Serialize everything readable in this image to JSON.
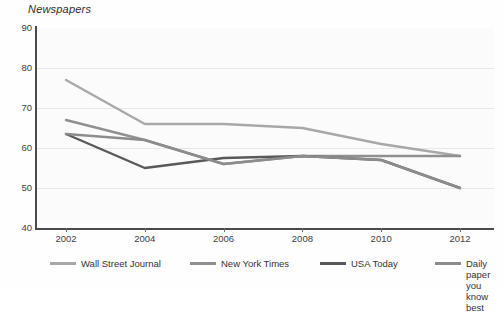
{
  "chart_data": {
    "type": "line",
    "title": "Newspapers",
    "xlabel": "",
    "ylabel": "",
    "x": [
      2002,
      2004,
      2006,
      2008,
      2010,
      2012
    ],
    "xticklabels": [
      "2002",
      "2004",
      "2006",
      "2008",
      "2010",
      "2012"
    ],
    "yticklabels": [
      "90",
      "80",
      "70",
      "60",
      "50",
      "40"
    ],
    "yticks": [
      90,
      80,
      70,
      60,
      50,
      40
    ],
    "ylim": [
      40,
      90
    ],
    "xlim": [
      2002,
      2012
    ],
    "grid": true,
    "legend_position": "bottom",
    "series": [
      {
        "name": "Wall Street Journal",
        "color": "#a8a8a8",
        "values": [
          77,
          66,
          66,
          65,
          61,
          58
        ]
      },
      {
        "name": "New York Times",
        "color": "#909090",
        "values": [
          67,
          62,
          56,
          58,
          58,
          58
        ]
      },
      {
        "name": "USA Today",
        "color": "#595959",
        "values": [
          63.5,
          55,
          57.5,
          58,
          57,
          50
        ]
      },
      {
        "name": "Daily paper you know best",
        "color": "#8c8c8c",
        "values": [
          63.5,
          62,
          56,
          58,
          57,
          50
        ]
      }
    ]
  },
  "chart": {
    "title": "Newspapers",
    "y_axis": {
      "ticks": [
        "90",
        "80",
        "70",
        "60",
        "50",
        "40"
      ]
    },
    "x_axis": {
      "ticks": [
        "2002",
        "2004",
        "2006",
        "2008",
        "2010",
        "2012"
      ]
    },
    "legend": {
      "items": [
        {
          "label": "Wall Street Journal",
          "color": "#a8a8a8"
        },
        {
          "label": "New York Times",
          "color": "#909090"
        },
        {
          "label": "USA Today",
          "color": "#595959"
        },
        {
          "label": "Daily paper you\nknow best",
          "color": "#8c8c8c"
        }
      ]
    }
  }
}
